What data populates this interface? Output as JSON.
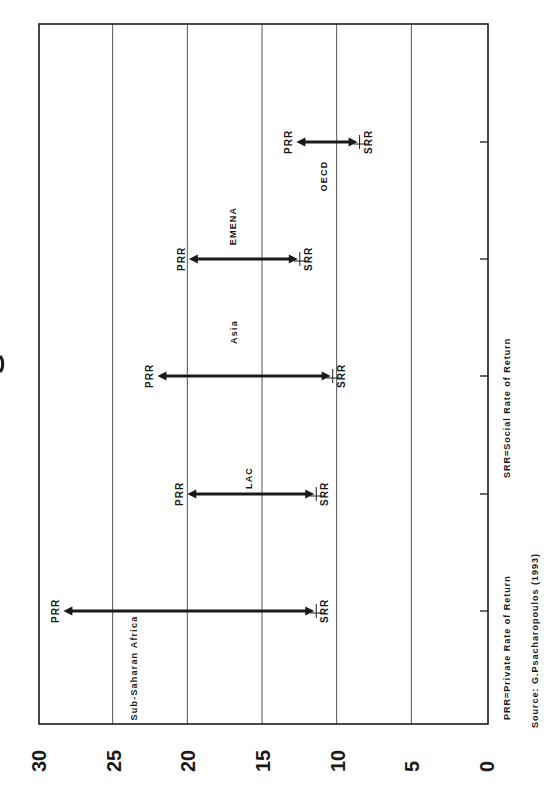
{
  "chart_data": {
    "type": "range-arrow",
    "orientation": "rotated-90-ccw",
    "title": "",
    "xlabel": "",
    "ylabel": "",
    "categories": [
      "Sub-Saharan Africa",
      "LAC",
      "Asia",
      "EMENA",
      "OECD"
    ],
    "series": [
      {
        "name": "PRR",
        "label": "PRR=Private Rate of Return",
        "values": [
          28.3,
          20.0,
          22.0,
          19.9,
          12.7
        ]
      },
      {
        "name": "SRR",
        "label": "SRR=Social Rate of Return",
        "values": [
          11.5,
          11.5,
          10.4,
          12.6,
          8.6
        ]
      }
    ],
    "value_axis": {
      "ticks": [
        0,
        5,
        10,
        15,
        20,
        25,
        30
      ],
      "tick_labels": [
        "0",
        "5",
        "10",
        "15",
        "20",
        "25",
        "30"
      ],
      "range": [
        0,
        30
      ],
      "grid": true
    },
    "point_labels": {
      "prr": "PRR",
      "srr": "SRR"
    },
    "legend": {
      "prr_note": "PRR=Private Rate of Return",
      "srr_note": "SRR=Social Rate of Return",
      "position": "bottom"
    },
    "source": "Source: G.Psacharopoulos (1993)"
  },
  "colors": {
    "ink": "#1a1a1a",
    "grid": "#555555",
    "background": "#ffffff"
  }
}
